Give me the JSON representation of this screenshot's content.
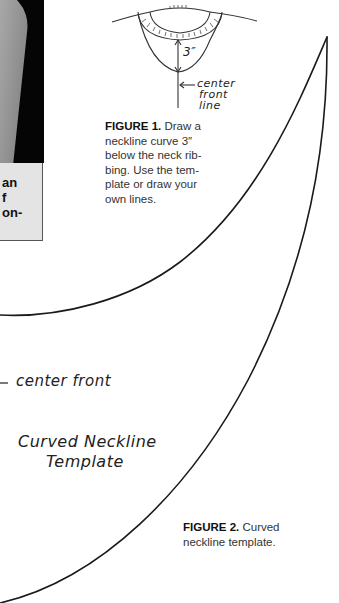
{
  "photo": {
    "caption_fragments": [
      "an",
      "f",
      "on-"
    ]
  },
  "figure1": {
    "label": "FIGURE 1.",
    "text_lines": [
      "Draw a",
      "neckline curve 3″",
      "below the neck rib-",
      "bing. Use the tem-",
      "plate or draw your",
      "own lines."
    ],
    "measurement_label": "3″",
    "annotation_lines": [
      "center",
      "front",
      "line"
    ]
  },
  "template": {
    "center_front_label": "center front",
    "title_lines": [
      "Curved Neckline",
      "Template"
    ]
  },
  "figure2": {
    "label": "FIGURE 2.",
    "text_lines": [
      "Curved",
      "neckline template."
    ]
  }
}
